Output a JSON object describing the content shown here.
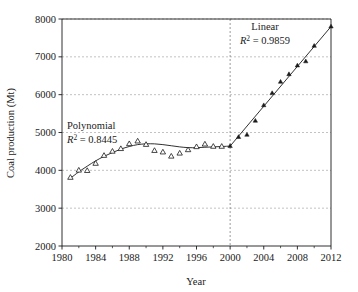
{
  "chart_data": {
    "type": "scatter",
    "title": "",
    "subtitle": "",
    "xlabel": "Year",
    "ylabel": "Coal production (Mt)",
    "xlim": [
      1980,
      2012
    ],
    "ylim": [
      2000,
      8000
    ],
    "grid": true,
    "grid_axis": "y-major-dashed",
    "legend": "none",
    "xticks": [
      1980,
      1984,
      1988,
      1992,
      1996,
      2000,
      2004,
      2008,
      2012
    ],
    "xtick_labels": [
      "1980",
      "1984",
      "1988",
      "1992",
      "1996",
      "2000",
      "2004",
      "2008",
      "2012"
    ],
    "xticks_minor": [
      1982,
      1986,
      1990,
      1994,
      1998,
      2002,
      2006,
      2010
    ],
    "yticks": [
      2000,
      3000,
      4000,
      5000,
      6000,
      7000,
      8000
    ],
    "ytick_labels": [
      "2000",
      "3000",
      "4000",
      "5000",
      "6000",
      "7000",
      "8000"
    ],
    "marker_open_symbol": "open-triangle",
    "marker_filled_symbol": "filled-triangle",
    "series": [
      {
        "name": "Coal production (polynomial period)",
        "marker": "open-triangle",
        "x": [
          1981,
          1982,
          1983,
          1984,
          1985,
          1986,
          1987,
          1988,
          1989,
          1990,
          1991,
          1992,
          1993,
          1994,
          1995,
          1996,
          1997,
          1998,
          1999
        ],
        "values": [
          3810,
          4000,
          3990,
          4180,
          4390,
          4500,
          4570,
          4700,
          4770,
          4680,
          4520,
          4480,
          4370,
          4450,
          4540,
          4620,
          4690,
          4630,
          4630
        ]
      },
      {
        "name": "Coal production (linear period)",
        "marker": "filled-triangle",
        "x": [
          2000,
          2001,
          2002,
          2003,
          2004,
          2005,
          2006,
          2007,
          2008,
          2009,
          2010,
          2012
        ],
        "values": [
          4640,
          4880,
          4940,
          5310,
          5720,
          6040,
          6340,
          6540,
          6770,
          6880,
          7290,
          7800
        ]
      }
    ],
    "trendlines": [
      {
        "name": "Polynomial",
        "label": "Polynomial",
        "r2_label": "R",
        "r2_exponent": "2",
        "r2_equals": " = 0.8445",
        "r2_value": 0.8445,
        "x_range": [
          1981,
          2000
        ],
        "fit_points_x": [
          1981,
          1982,
          1983,
          1984,
          1985,
          1986,
          1987,
          1988,
          1989,
          1990,
          1991,
          1992,
          1993,
          1994,
          1995,
          1996,
          1997,
          1998,
          1999,
          2000
        ],
        "fit_points_y": [
          3790,
          3960,
          4110,
          4250,
          4370,
          4470,
          4560,
          4630,
          4680,
          4700,
          4700,
          4680,
          4650,
          4620,
          4600,
          4600,
          4610,
          4620,
          4630,
          4640
        ]
      },
      {
        "name": "Linear",
        "label": "Linear",
        "r2_label": "R",
        "r2_exponent": "2",
        "r2_equals": " = 0.9859",
        "r2_value": 0.9859,
        "x_range": [
          2000,
          2012
        ],
        "fit_points_x": [
          2000,
          2012
        ],
        "fit_points_y": [
          4640,
          7800
        ]
      }
    ],
    "divider_line": {
      "name": "year-2000-divider",
      "x": 2000,
      "style": "dashed-vertical"
    },
    "colors": {
      "axis": "#1a1a1a",
      "grid": "#9a9a9a",
      "marker": "#1a1a1a",
      "trendline": "#1a1a1a",
      "background": "#ffffff"
    }
  },
  "annotations": {
    "polynomial_label": "Polynomial",
    "polynomial_r2_text": " = 0.8445",
    "linear_label": "Linear",
    "linear_r2_text": " = 0.9859",
    "r2_symbol": "R",
    "r2_sup": "2"
  },
  "axes": {
    "x_title": "Year",
    "y_title": "Coal production (Mt)"
  }
}
